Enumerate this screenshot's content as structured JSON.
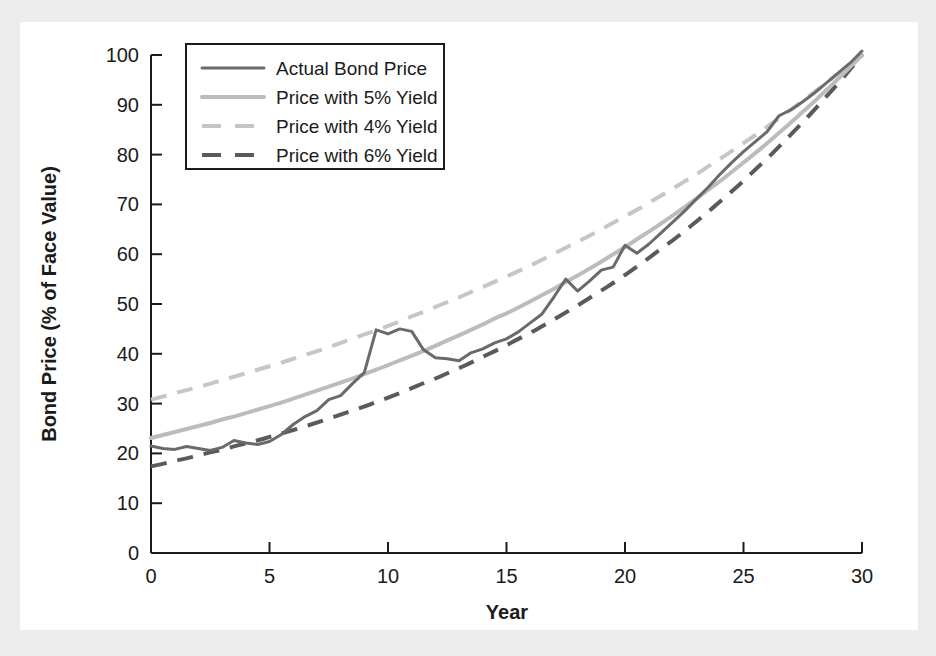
{
  "chart_data": {
    "type": "line",
    "title": "",
    "xlabel": "Year",
    "ylabel": "Bond Price (% of Face Value)",
    "xlim": [
      0,
      30
    ],
    "ylim": [
      0,
      100
    ],
    "xticks": [
      0,
      5,
      10,
      15,
      20,
      25,
      30
    ],
    "yticks": [
      0,
      10,
      20,
      30,
      40,
      50,
      60,
      70,
      80,
      90,
      100
    ],
    "grid": false,
    "legend_position": "upper-left",
    "x": [
      0,
      0.5,
      1,
      1.5,
      2,
      2.5,
      3,
      3.5,
      4,
      4.5,
      5,
      5.5,
      6,
      6.5,
      7,
      7.5,
      8,
      8.5,
      9,
      9.5,
      10,
      10.5,
      11,
      11.5,
      12,
      12.5,
      13,
      13.5,
      14,
      14.5,
      15,
      15.5,
      16,
      16.5,
      17,
      17.5,
      18,
      18.5,
      19,
      19.5,
      20,
      20.5,
      21,
      21.5,
      22,
      22.5,
      23,
      23.5,
      24,
      24.5,
      25,
      25.5,
      26,
      26.5,
      27,
      27.5,
      28,
      28.5,
      29,
      29.5,
      30
    ],
    "series": [
      {
        "name": "Actual Bond Price",
        "style": "solid",
        "color": "#6a6a6a",
        "width": 3,
        "values": [
          21.5,
          21.0,
          20.8,
          21.4,
          21.0,
          20.6,
          21.2,
          22.6,
          22.1,
          21.8,
          22.4,
          23.8,
          25.8,
          27.4,
          28.6,
          30.8,
          31.6,
          34.0,
          36.2,
          44.8,
          44.0,
          45.0,
          44.5,
          40.8,
          39.2,
          39.0,
          38.6,
          40.2,
          41.0,
          42.2,
          43.0,
          44.4,
          46.2,
          48.0,
          51.4,
          55.0,
          52.6,
          54.6,
          56.8,
          57.4,
          61.8,
          60.2,
          62.0,
          64.2,
          66.4,
          68.6,
          71.0,
          73.4,
          76.0,
          78.4,
          80.6,
          82.6,
          84.6,
          87.8,
          89.0,
          90.6,
          92.4,
          94.4,
          96.4,
          98.4,
          100.8
        ]
      },
      {
        "name": "Price with 5% Yield",
        "style": "solid",
        "color": "#bcbcbc",
        "width": 4,
        "values": [
          23.1,
          23.7,
          24.3,
          24.9,
          25.5,
          26.1,
          26.8,
          27.4,
          28.1,
          28.8,
          29.5,
          30.2,
          31.0,
          31.8,
          32.6,
          33.4,
          34.2,
          35.0,
          35.9,
          36.8,
          37.7,
          38.7,
          39.6,
          40.6,
          41.6,
          42.7,
          43.7,
          44.8,
          45.9,
          47.1,
          48.1,
          49.3,
          50.5,
          51.8,
          53.0,
          54.4,
          55.7,
          57.1,
          58.5,
          60.0,
          61.4,
          63.0,
          64.5,
          66.1,
          67.7,
          69.4,
          71.1,
          72.9,
          74.6,
          76.5,
          78.4,
          80.3,
          82.3,
          84.4,
          86.4,
          88.6,
          90.7,
          93.0,
          95.2,
          97.6,
          100.0
        ]
      },
      {
        "name": "Price with 4% Yield",
        "style": "dashed",
        "color": "#c6c6c6",
        "width": 4,
        "values": [
          30.8,
          31.4,
          32.1,
          32.7,
          33.3,
          34.0,
          34.7,
          35.4,
          36.1,
          36.8,
          37.5,
          38.2,
          39.0,
          39.8,
          40.5,
          41.3,
          42.2,
          43.0,
          43.9,
          44.7,
          45.6,
          46.5,
          47.5,
          48.4,
          49.4,
          50.4,
          51.3,
          52.4,
          53.4,
          54.5,
          55.5,
          56.6,
          57.7,
          58.9,
          60.1,
          61.3,
          62.5,
          63.7,
          65.0,
          66.3,
          67.6,
          68.9,
          70.3,
          71.7,
          73.1,
          74.6,
          76.0,
          77.6,
          79.1,
          80.7,
          82.3,
          83.9,
          85.6,
          87.3,
          89.0,
          90.8,
          92.6,
          94.4,
          96.3,
          98.1,
          100.0
        ]
      },
      {
        "name": "Price with 6% Yield",
        "style": "dashed",
        "color": "#5a5a5a",
        "width": 4,
        "values": [
          17.4,
          17.9,
          18.5,
          19.0,
          19.6,
          20.2,
          20.7,
          21.4,
          22.0,
          22.6,
          23.3,
          24.0,
          24.7,
          25.4,
          26.2,
          27.0,
          27.8,
          28.6,
          29.4,
          30.3,
          31.2,
          32.1,
          33.1,
          34.1,
          35.0,
          36.1,
          37.1,
          38.2,
          39.4,
          40.5,
          41.7,
          43.0,
          44.2,
          45.5,
          46.9,
          48.3,
          49.7,
          51.2,
          52.7,
          54.2,
          55.8,
          57.5,
          59.2,
          61.0,
          62.7,
          64.6,
          66.5,
          68.5,
          70.5,
          72.6,
          74.7,
          77.0,
          79.2,
          81.6,
          84.0,
          86.5,
          89.0,
          91.7,
          94.3,
          97.1,
          100.0
        ]
      }
    ]
  },
  "legend": {
    "items": [
      {
        "label": "Actual Bond Price"
      },
      {
        "label": "Price with 5% Yield"
      },
      {
        "label": "Price with 4% Yield"
      },
      {
        "label": "Price with 6% Yield"
      }
    ]
  }
}
